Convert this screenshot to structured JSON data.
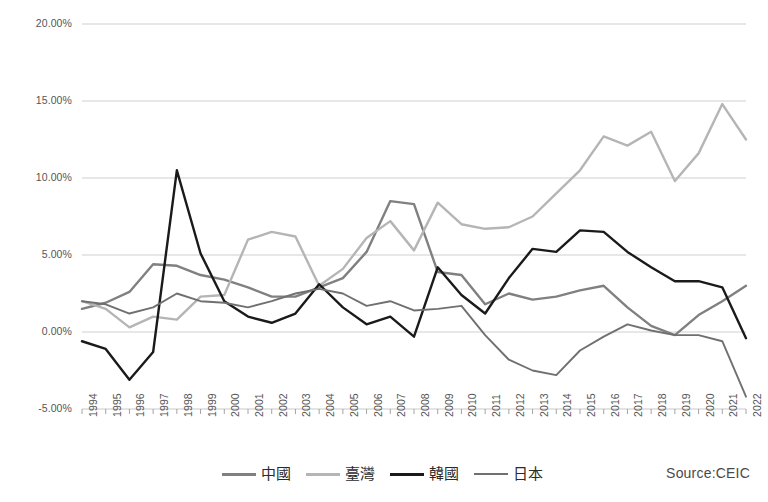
{
  "chart_data": {
    "type": "line",
    "title": "",
    "xlabel": "",
    "ylabel": "",
    "ylim": [
      -5,
      20
    ],
    "ytick_labels": [
      "20.00%",
      "15.00%",
      "10.00%",
      "5.00%",
      "0.00%",
      "-5.00%"
    ],
    "ytick_values": [
      20,
      15,
      10,
      5,
      0,
      -5
    ],
    "grid": true,
    "legend_position": "bottom",
    "source": "Source:CEIC",
    "categories": [
      "1994",
      "1995",
      "1996",
      "1997",
      "1998",
      "1999",
      "2000",
      "2001",
      "2002",
      "2003",
      "2004",
      "2005",
      "2006",
      "2007",
      "2008",
      "2009",
      "2010",
      "2011",
      "2012",
      "2013",
      "2014",
      "2015",
      "2016",
      "2017",
      "2018",
      "2019",
      "2020",
      "2021",
      "2022"
    ],
    "series": [
      {
        "name": "中國",
        "color": "#808080",
        "width": 2.4,
        "values": [
          1.5,
          1.9,
          2.6,
          4.4,
          4.3,
          3.7,
          3.4,
          2.9,
          2.3,
          2.3,
          2.9,
          3.5,
          5.2,
          8.5,
          8.3,
          3.9,
          3.7,
          1.8,
          2.5,
          2.1,
          2.3,
          2.7,
          3.0,
          1.6,
          0.4,
          -0.2,
          1.1,
          2.0,
          3.0
        ]
      },
      {
        "name": "臺灣",
        "color": "#b5b5b5",
        "width": 2.4,
        "values": [
          2.0,
          1.5,
          0.3,
          1.0,
          0.8,
          2.3,
          2.4,
          6.0,
          6.5,
          6.2,
          3.0,
          4.1,
          6.1,
          7.2,
          5.3,
          8.4,
          7.0,
          6.7,
          6.8,
          7.5,
          9.0,
          10.5,
          12.7,
          12.1,
          13.0,
          9.8,
          11.6,
          14.8,
          12.5
        ]
      },
      {
        "name": "韓國",
        "color": "#1a1a1a",
        "width": 2.4,
        "values": [
          -0.6,
          -1.1,
          -3.1,
          -1.3,
          10.5,
          5.1,
          2.0,
          1.0,
          0.6,
          1.2,
          3.1,
          1.6,
          0.5,
          1.0,
          -0.3,
          4.2,
          2.4,
          1.2,
          3.5,
          5.4,
          5.2,
          6.6,
          6.5,
          5.2,
          4.2,
          3.3,
          3.3,
          2.9,
          -0.4
        ]
      },
      {
        "name": "日本",
        "color": "#707070",
        "width": 1.9,
        "values": [
          2.0,
          1.8,
          1.2,
          1.6,
          2.5,
          2.0,
          1.9,
          1.6,
          2.0,
          2.5,
          2.8,
          2.5,
          1.7,
          2.0,
          1.4,
          1.5,
          1.7,
          -0.2,
          -1.8,
          -2.5,
          -2.8,
          -1.2,
          -0.3,
          0.5,
          0.1,
          -0.2,
          -0.2,
          -0.6,
          -4.2
        ]
      }
    ]
  },
  "axis": {
    "ytick_labels": [
      "20.00%",
      "15.00%",
      "10.00%",
      "5.00%",
      "0.00%",
      "-5.00%"
    ],
    "xtick_labels": [
      "1994",
      "1995",
      "1996",
      "1997",
      "1998",
      "1999",
      "2000",
      "2001",
      "2002",
      "2003",
      "2004",
      "2005",
      "2006",
      "2007",
      "2008",
      "2009",
      "2010",
      "2011",
      "2012",
      "2013",
      "2014",
      "2015",
      "2016",
      "2017",
      "2018",
      "2019",
      "2020",
      "2021",
      "2022"
    ]
  },
  "legend": {
    "items": [
      {
        "label": "中國",
        "color": "#808080",
        "width": 3.4
      },
      {
        "label": "臺灣",
        "color": "#b5b5b5",
        "width": 3.0
      },
      {
        "label": "韓國",
        "color": "#1a1a1a",
        "width": 3.4
      },
      {
        "label": "日本",
        "color": "#707070",
        "width": 2.2
      }
    ]
  },
  "footer": {
    "source": "Source:CEIC"
  },
  "colors": {
    "gridline": "#c9c9c9",
    "axis": "#9a9a9a",
    "text": "#555555",
    "china": "#808080",
    "taiwan": "#b5b5b5",
    "korea": "#1a1a1a",
    "japan": "#707070"
  }
}
